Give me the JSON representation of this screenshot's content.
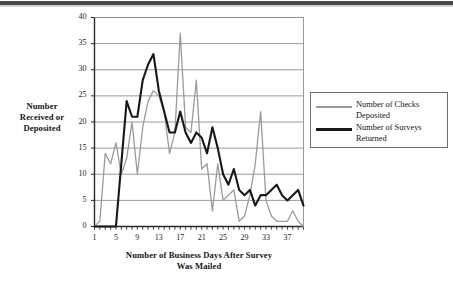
{
  "figure": {
    "background_color": "#ffffff",
    "scan_artifact_color": "#4a4745"
  },
  "chart_data": {
    "type": "line",
    "title": "",
    "xlabel": "Number of Business Days After Survey Was Mailed",
    "ylabel": "Number Received or Deposited",
    "xlim": [
      1,
      40
    ],
    "ylim": [
      0,
      40
    ],
    "grid": "horizontal",
    "legend_position": "right",
    "x": [
      1,
      2,
      3,
      4,
      5,
      6,
      7,
      8,
      9,
      10,
      11,
      12,
      13,
      14,
      15,
      16,
      17,
      18,
      19,
      20,
      21,
      22,
      23,
      24,
      25,
      26,
      27,
      28,
      29,
      30,
      31,
      32,
      33,
      34,
      35,
      36,
      37,
      38,
      39,
      40
    ],
    "xticks": [
      1,
      5,
      9,
      13,
      17,
      21,
      25,
      29,
      33,
      37
    ],
    "yticks": [
      0,
      5,
      10,
      15,
      20,
      25,
      30,
      35,
      40
    ],
    "series": [
      {
        "name": "Number of Checks Deposited",
        "color": "#9b9b9b",
        "line_width": 1.3,
        "values": [
          0,
          1,
          14,
          12,
          16,
          10,
          13,
          20,
          10,
          19,
          24,
          26,
          25,
          22,
          14,
          18,
          37,
          19,
          18,
          28,
          11,
          12,
          3,
          12,
          5,
          6,
          7,
          1,
          2,
          6,
          12,
          22,
          5,
          2,
          1,
          1,
          1,
          3,
          1,
          0
        ]
      },
      {
        "name": "Number of Surveys Returned",
        "color": "#181818",
        "line_width": 2.1,
        "values": [
          0,
          0,
          0,
          0,
          0,
          12,
          24,
          21,
          21,
          28,
          31,
          33,
          26,
          22,
          18,
          18,
          22,
          18,
          16,
          18,
          17,
          14,
          19,
          15,
          10,
          8,
          11,
          7,
          6,
          7,
          4,
          6,
          6,
          7,
          8,
          6,
          5,
          6,
          7,
          4
        ]
      }
    ]
  },
  "legend": {
    "items": [
      {
        "label_line1": "Number of Checks",
        "label_line2": "Deposited",
        "style": "gray"
      },
      {
        "label_line1": "Number of Surveys",
        "label_line2": "Returned",
        "style": "black"
      }
    ]
  },
  "axis_titles": {
    "y_line1": "Number",
    "y_line2": "Received or",
    "y_line3": "Deposited",
    "x_line1": "Number of Business Days After Survey",
    "x_line2": "Was Mailed"
  }
}
